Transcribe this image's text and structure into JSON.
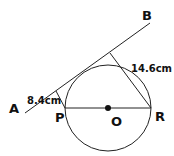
{
  "diagram": {
    "type": "geometry",
    "stroke_color": "#222222",
    "points": {
      "A": {
        "label": "A"
      },
      "B": {
        "label": "B"
      },
      "P": {
        "label": "P"
      },
      "O": {
        "label": "O"
      },
      "R": {
        "label": "R"
      }
    },
    "measurements": {
      "p_to_tangent": "8.4cm",
      "r_to_tangent": "14.6cm"
    }
  }
}
